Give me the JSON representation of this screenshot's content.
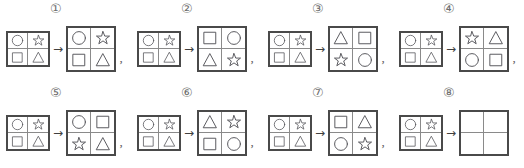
{
  "exercise": {
    "shape_names": {
      "circle": "circle",
      "star": "star",
      "square": "square",
      "triangle": "triangle",
      "empty": ""
    },
    "arrow_glyph": "→",
    "comma_glyph": ",",
    "rows": [
      {
        "items": [
          {
            "label": "①",
            "source": {
              "cells": [
                "circle",
                "star",
                "square",
                "triangle"
              ]
            },
            "result": {
              "cells": [
                "circle",
                "star",
                "square",
                "triangle"
              ]
            },
            "separator": ","
          },
          {
            "label": "②",
            "source": {
              "cells": [
                "circle",
                "star",
                "square",
                "triangle"
              ]
            },
            "result": {
              "cells": [
                "square",
                "circle",
                "triangle",
                "star"
              ]
            },
            "separator": ","
          },
          {
            "label": "③",
            "source": {
              "cells": [
                "circle",
                "star",
                "square",
                "triangle"
              ]
            },
            "result": {
              "cells": [
                "triangle",
                "square",
                "star",
                "circle"
              ]
            },
            "separator": ","
          },
          {
            "label": "④",
            "source": {
              "cells": [
                "circle",
                "star",
                "square",
                "triangle"
              ]
            },
            "result": {
              "cells": [
                "star",
                "triangle",
                "circle",
                "square"
              ]
            },
            "separator": ","
          }
        ]
      },
      {
        "items": [
          {
            "label": "⑤",
            "source": {
              "cells": [
                "circle",
                "star",
                "square",
                "triangle"
              ]
            },
            "result": {
              "cells": [
                "circle",
                "square",
                "star",
                "triangle"
              ]
            },
            "separator": ","
          },
          {
            "label": "⑥",
            "source": {
              "cells": [
                "circle",
                "star",
                "square",
                "triangle"
              ]
            },
            "result": {
              "cells": [
                "triangle",
                "star",
                "square",
                "circle"
              ]
            },
            "separator": ","
          },
          {
            "label": "⑦",
            "source": {
              "cells": [
                "circle",
                "star",
                "square",
                "triangle"
              ]
            },
            "result": {
              "cells": [
                "square",
                "triangle",
                "circle",
                "star"
              ]
            },
            "separator": ","
          },
          {
            "label": "⑧",
            "source": {
              "cells": [
                "circle",
                "star",
                "square",
                "triangle"
              ]
            },
            "result": {
              "cells": [
                "empty",
                "empty",
                "empty",
                "empty"
              ]
            },
            "separator": ""
          }
        ]
      }
    ]
  }
}
